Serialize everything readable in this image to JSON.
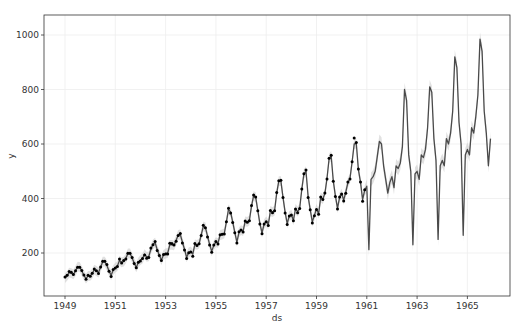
{
  "chart_data": {
    "type": "line",
    "title": "",
    "xlabel": "ds",
    "ylabel": "y",
    "xlim": [
      1948.2,
      1966.8
    ],
    "ylim": [
      40,
      1080
    ],
    "grid": true,
    "legend": null,
    "x_ticks": [
      1949,
      1951,
      1953,
      1955,
      1957,
      1959,
      1961,
      1963,
      1965
    ],
    "y_ticks": [
      200,
      400,
      600,
      800,
      1000
    ],
    "colors": {
      "observed_points": "#000000",
      "forecast_line": "#4a4a4a",
      "uncertainty_band": "#c8c8c8",
      "grid": "#eeeeee",
      "axis": "#333333"
    },
    "series": [
      {
        "name": "observed (y)",
        "style": "points",
        "start": 1949.0,
        "step_months": 1,
        "values": [
          112,
          118,
          132,
          129,
          121,
          135,
          148,
          148,
          136,
          119,
          104,
          118,
          115,
          126,
          141,
          135,
          125,
          149,
          170,
          170,
          158,
          133,
          114,
          140,
          145,
          150,
          178,
          163,
          172,
          178,
          199,
          199,
          184,
          162,
          146,
          166,
          171,
          180,
          193,
          181,
          183,
          218,
          230,
          242,
          209,
          191,
          172,
          194,
          196,
          196,
          236,
          235,
          229,
          243,
          264,
          272,
          237,
          211,
          180,
          201,
          204,
          188,
          235,
          227,
          234,
          264,
          302,
          293,
          259,
          229,
          203,
          229,
          242,
          233,
          267,
          269,
          270,
          315,
          364,
          347,
          312,
          274,
          237,
          278,
          284,
          277,
          317,
          313,
          318,
          374,
          413,
          405,
          355,
          306,
          271,
          306,
          315,
          301,
          356,
          348,
          355,
          422,
          465,
          467,
          404,
          347,
          305,
          336,
          340,
          318,
          362,
          348,
          363,
          435,
          491,
          505,
          404,
          359,
          310,
          337,
          360,
          342,
          406,
          396,
          420,
          472,
          548,
          559,
          463,
          407,
          362,
          405,
          417,
          391,
          419,
          461,
          472,
          535,
          622,
          606,
          508,
          461,
          390,
          432
        ]
      },
      {
        "name": "forecast (yhat)",
        "style": "line",
        "start": 1949.0,
        "step_months": 1,
        "values": [
          108,
          116,
          128,
          126,
          122,
          134,
          150,
          149,
          134,
          118,
          106,
          116,
          116,
          124,
          139,
          134,
          128,
          148,
          168,
          168,
          154,
          134,
          118,
          137,
          146,
          152,
          172,
          166,
          168,
          180,
          198,
          199,
          182,
          163,
          147,
          166,
          174,
          180,
          196,
          186,
          188,
          214,
          232,
          238,
          212,
          192,
          174,
          193,
          198,
          200,
          230,
          230,
          228,
          246,
          266,
          268,
          240,
          214,
          184,
          202,
          206,
          196,
          232,
          230,
          234,
          266,
          298,
          294,
          262,
          232,
          206,
          228,
          240,
          236,
          266,
          268,
          272,
          314,
          360,
          350,
          314,
          276,
          240,
          276,
          284,
          280,
          316,
          314,
          320,
          372,
          410,
          404,
          356,
          308,
          274,
          306,
          316,
          304,
          354,
          350,
          356,
          420,
          464,
          464,
          404,
          350,
          308,
          336,
          340,
          320,
          362,
          352,
          364,
          434,
          490,
          500,
          408,
          360,
          314,
          338,
          362,
          344,
          404,
          398,
          418,
          474,
          546,
          556,
          464,
          410,
          364,
          404,
          418,
          394,
          424,
          458,
          474,
          534,
          600,
          602,
          506,
          460,
          396,
          430,
          445,
          212,
          470,
          480,
          500,
          555,
          610,
          600,
          520,
          470,
          420,
          460,
          480,
          440,
          520,
          510,
          530,
          590,
          800,
          760,
          560,
          500,
          230,
          490,
          500,
          470,
          560,
          550,
          580,
          660,
          810,
          790,
          620,
          540,
          250,
          520,
          540,
          520,
          620,
          600,
          640,
          720,
          920,
          880,
          680,
          600,
          265,
          560,
          580,
          560,
          660,
          640,
          700,
          780,
          985,
          940,
          720,
          640,
          520,
          620
        ]
      }
    ]
  }
}
